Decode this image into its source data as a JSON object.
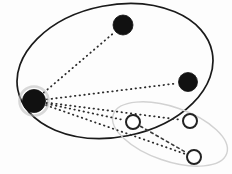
{
  "canvas": {
    "width": 232,
    "height": 174,
    "background": "#fdfdfd",
    "title": "Two overlapping ellipse clusters with filled and hollow nodes joined by dotted edges"
  },
  "palette": {
    "node_filled": "#111111",
    "node_hollow_stroke": "#222222",
    "node_hollow_fill": "#ffffff",
    "halo": "#b9b9b9",
    "ellipse_primary_stroke": "#1a1a1a",
    "ellipse_secondary_stroke": "#d2d2d2",
    "edge_dotted": "#2b2b2b",
    "edge_dashed": "#3a3a3a"
  },
  "groups": [
    {
      "id": "primary-cluster",
      "name": "primary-ellipse",
      "shape": "ellipse",
      "cx": 115,
      "cy": 71,
      "rx": 99,
      "ry": 66,
      "rotation": -11,
      "stroke": "#1a1a1a",
      "stroke_width": 1.7,
      "fill": "none",
      "style": "solid"
    },
    {
      "id": "secondary-cluster",
      "name": "secondary-ellipse",
      "shape": "ellipse",
      "cx": 170,
      "cy": 134,
      "rx": 60,
      "ry": 27,
      "rotation": 19,
      "stroke": "#d2d2d2",
      "stroke_width": 1.4,
      "fill": "none",
      "style": "solid"
    }
  ],
  "nodes": [
    {
      "id": "n1",
      "name": "filled-node-left",
      "type": "filled",
      "cx": 34,
      "cy": 101,
      "r": 11.5,
      "halo": true,
      "halo_r": 14.5,
      "fill": "#111111",
      "group": "primary-cluster"
    },
    {
      "id": "n2",
      "name": "filled-node-top",
      "type": "filled",
      "cx": 123,
      "cy": 25,
      "r": 10,
      "halo": false,
      "halo_r": 0,
      "fill": "#111111",
      "group": "primary-cluster"
    },
    {
      "id": "n3",
      "name": "filled-node-right",
      "type": "filled",
      "cx": 188,
      "cy": 82,
      "r": 9.5,
      "halo": false,
      "halo_r": 0,
      "fill": "#111111",
      "group": "primary-cluster"
    },
    {
      "id": "n4",
      "name": "hollow-node-center",
      "type": "hollow",
      "cx": 133,
      "cy": 122,
      "r": 7,
      "halo": false,
      "halo_r": 0,
      "fill": "#ffffff",
      "group": "secondary-cluster"
    },
    {
      "id": "n5",
      "name": "hollow-node-right",
      "type": "hollow",
      "cx": 190,
      "cy": 121,
      "r": 7,
      "halo": false,
      "halo_r": 0,
      "fill": "#ffffff",
      "group": "secondary-cluster"
    },
    {
      "id": "n6",
      "name": "hollow-node-bottom",
      "type": "hollow",
      "cx": 194,
      "cy": 157,
      "r": 7,
      "halo": false,
      "halo_r": 0,
      "fill": "#ffffff",
      "group": "secondary-cluster"
    }
  ],
  "edges": [
    {
      "id": "e1",
      "name": "edge-left-to-top",
      "from": "n1",
      "to": "n2",
      "style": "dotted",
      "stroke": "#2b2b2b",
      "stroke_width": 1.8,
      "dash": "0.5 4.2"
    },
    {
      "id": "e2",
      "name": "edge-left-to-right",
      "from": "n1",
      "to": "n3",
      "style": "dotted",
      "stroke": "#2b2b2b",
      "stroke_width": 1.8,
      "dash": "0.5 4.2"
    },
    {
      "id": "e3",
      "name": "edge-left-to-hollow-center",
      "from": "n1",
      "to": "n4",
      "style": "dotted",
      "stroke": "#2b2b2b",
      "stroke_width": 1.8,
      "dash": "0.5 4.2"
    },
    {
      "id": "e4",
      "name": "edge-left-to-hollow-right",
      "from": "n1",
      "to": "n5",
      "style": "dotted",
      "stroke": "#2b2b2b",
      "stroke_width": 1.8,
      "dash": "0.5 4.2"
    },
    {
      "id": "e5",
      "name": "edge-left-to-hollow-bottom",
      "from": "n1",
      "to": "n6",
      "style": "dotted",
      "stroke": "#2b2b2b",
      "stroke_width": 1.8,
      "dash": "0.5 4.2"
    },
    {
      "id": "e6",
      "name": "edge-hollow-center-to-hollow-bottom",
      "from": "n4",
      "to": "n6",
      "style": "dashed",
      "stroke": "#3a3a3a",
      "stroke_width": 1.6,
      "dash": "2.6 3.4"
    }
  ]
}
